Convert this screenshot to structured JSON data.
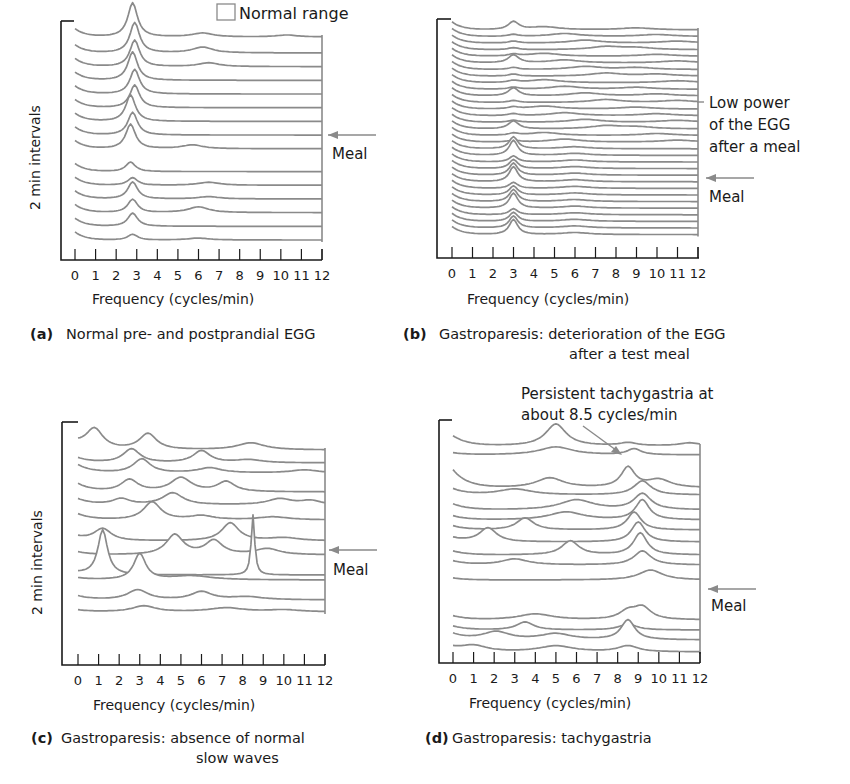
{
  "legend": {
    "normal_range_label": "Normal range"
  },
  "common": {
    "ylabel": "2 min intervals",
    "xlabel": "Frequency (cycles/min)",
    "ticks": [
      "0",
      "1",
      "2",
      "3",
      "4",
      "5",
      "6",
      "7",
      "8",
      "9",
      "10",
      "11",
      "12"
    ],
    "meal_label": "Meal"
  },
  "panels": {
    "a": {
      "letter": "(a)",
      "caption_line1": "Normal pre- and postprandial EGG",
      "caption_line2": ""
    },
    "b": {
      "letter": "(b)",
      "caption_line1": "Gastroparesis: deterioration of the EGG",
      "caption_line2": "after a test meal",
      "annotation_lines": [
        "Low power",
        "of the EGG",
        "after a meal"
      ]
    },
    "c": {
      "letter": "(c)",
      "caption_line1": "Gastroparesis: absence of normal",
      "caption_line2": "slow waves"
    },
    "d": {
      "letter": "(d)",
      "caption_line1": "Gastroparesis: tachygastria",
      "caption_line2": "",
      "annotation_lines": [
        "Persistent tachygastria at",
        "about 8.5 cycles/min"
      ]
    }
  },
  "colors": {
    "trace": "#8a8a8a",
    "axis": "#1a1a1a",
    "text": "#1a1a1a",
    "background": "#ffffff"
  },
  "chart_data": [
    {
      "id": "a",
      "type": "area",
      "title": "(a) Normal pre- and postprandial EGG",
      "xlabel": "Frequency (cycles/min)",
      "ylabel": "2 min intervals",
      "xlim": [
        0,
        12
      ],
      "xticks": [
        0,
        1,
        2,
        3,
        4,
        5,
        6,
        7,
        8,
        9,
        10,
        11,
        12
      ],
      "grid": false,
      "legend": "Normal range (open box, top right)",
      "annotations": [
        {
          "text": "Meal",
          "arrow_at_trace_gap": true
        }
      ],
      "description": "Running spectra: dominant peak near 3 cycles/min persists before and after meal; small secondary peaks near 6 cycles/min",
      "traces_before_meal": [
        {
          "base": 0.95,
          "peaks": [
            [
              2.8,
              0.9
            ],
            [
              6.2,
              0.1
            ],
            [
              10.3,
              0.05
            ]
          ]
        },
        {
          "base": 0.88,
          "peaks": [
            [
              2.9,
              0.8
            ],
            [
              6.2,
              0.15
            ]
          ]
        },
        {
          "base": 0.82,
          "peaks": [
            [
              2.9,
              0.7
            ],
            [
              6.5,
              0.1
            ]
          ]
        },
        {
          "base": 0.76,
          "peaks": [
            [
              2.8,
              0.75
            ]
          ]
        },
        {
          "base": 0.7,
          "peaks": [
            [
              2.9,
              0.65
            ]
          ]
        },
        {
          "base": 0.64,
          "peaks": [
            [
              2.9,
              0.6
            ]
          ]
        },
        {
          "base": 0.58,
          "peaks": [
            [
              2.7,
              0.7
            ]
          ]
        },
        {
          "base": 0.52,
          "peaks": [
            [
              2.8,
              0.6
            ]
          ]
        },
        {
          "base": 0.46,
          "peaks": [
            [
              2.7,
              0.65
            ],
            [
              5.7,
              0.1
            ]
          ]
        }
      ],
      "traces_after_meal": [
        {
          "base": 0.36,
          "peaks": [
            [
              2.7,
              0.25
            ]
          ]
        },
        {
          "base": 0.3,
          "peaks": [
            [
              2.8,
              0.2
            ],
            [
              6.5,
              0.08
            ]
          ]
        },
        {
          "base": 0.24,
          "peaks": [
            [
              2.8,
              0.45
            ],
            [
              6.5,
              0.06
            ]
          ]
        },
        {
          "base": 0.18,
          "peaks": [
            [
              2.8,
              0.35
            ],
            [
              6.0,
              0.15
            ]
          ]
        },
        {
          "base": 0.12,
          "peaks": [
            [
              2.8,
              0.35
            ]
          ]
        },
        {
          "base": 0.06,
          "peaks": [
            [
              2.8,
              0.15
            ],
            [
              6.0,
              0.05
            ]
          ]
        }
      ]
    },
    {
      "id": "b",
      "type": "area",
      "title": "(b) Gastroparesis: deterioration of the EGG after a test meal",
      "xlabel": "Frequency (cycles/min)",
      "ylabel": "2 min intervals",
      "xlim": [
        0,
        12
      ],
      "xticks": [
        0,
        1,
        2,
        3,
        4,
        5,
        6,
        7,
        8,
        9,
        10,
        11,
        12
      ],
      "grid": false,
      "annotations": [
        {
          "text": "Low power of the EGG after a meal"
        },
        {
          "text": "Meal"
        }
      ],
      "description": "Many closely spaced traces; ~3 cycles/min peak visible before meal, flattens after meal",
      "trace_count": 32
    },
    {
      "id": "c",
      "type": "area",
      "title": "(c) Gastroparesis: absence of normal slow waves",
      "xlabel": "Frequency (cycles/min)",
      "ylabel": "2 min intervals",
      "xlim": [
        0,
        12
      ],
      "xticks": [
        0,
        1,
        2,
        3,
        4,
        5,
        6,
        7,
        8,
        9,
        10,
        11,
        12
      ],
      "grid": false,
      "annotations": [
        {
          "text": "Meal"
        }
      ],
      "description": "Irregular peaks scattered across 1-12 cycles/min; sharp spike near 8.5 cycles/min; no consistent 3 cycles/min peak"
    },
    {
      "id": "d",
      "type": "area",
      "title": "(d) Gastroparesis: tachygastria",
      "xlabel": "Frequency (cycles/min)",
      "ylabel": "2 min intervals",
      "xlim": [
        0,
        12
      ],
      "xticks": [
        0,
        1,
        2,
        3,
        4,
        5,
        6,
        7,
        8,
        9,
        10,
        11,
        12
      ],
      "grid": false,
      "annotations": [
        {
          "text": "Persistent tachygastria at about 8.5 cycles/min"
        },
        {
          "text": "Meal"
        }
      ],
      "description": "Dominant peaks around 8.5-9 cycles/min persist across traces, before and after meal"
    }
  ]
}
